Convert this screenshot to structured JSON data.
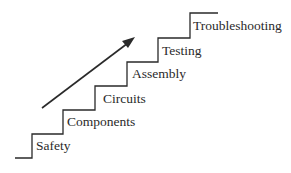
{
  "diagram": {
    "type": "staircase",
    "steps": [
      {
        "label": "Safety"
      },
      {
        "label": "Components"
      },
      {
        "label": "Circuits"
      },
      {
        "label": "Assembly"
      },
      {
        "label": "Testing"
      },
      {
        "label": "Troubleshooting"
      }
    ],
    "arrow": {
      "direction": "up-right"
    },
    "colors": {
      "line": "#2a2a2a",
      "text": "#2a2a2a",
      "background": "#ffffff"
    }
  }
}
